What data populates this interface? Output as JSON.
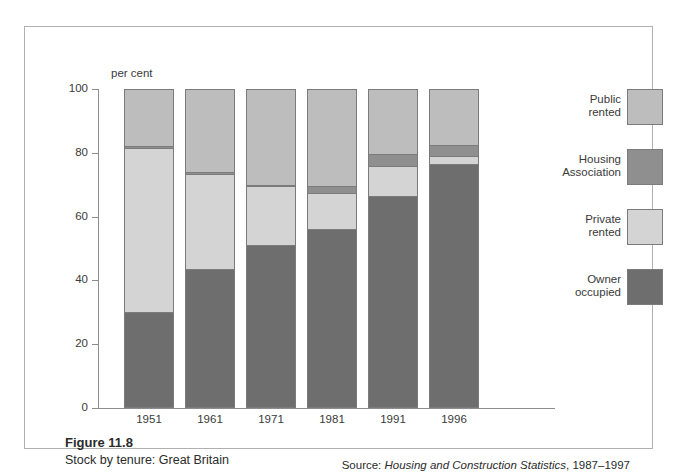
{
  "figure": {
    "number": "Figure 11.8",
    "title": "Stock by tenure: Great Britain",
    "source_prefix": "Source: ",
    "source_italic": "Housing and Construction Statistics",
    "source_suffix": ", 1987–1997"
  },
  "chart_data": {
    "type": "bar",
    "stacked": true,
    "title": "Stock by tenure: Great Britain",
    "xlabel": "",
    "ylabel": "per cent",
    "ylim": [
      0,
      100
    ],
    "yticks": [
      0,
      20,
      40,
      60,
      80,
      100
    ],
    "grid": false,
    "legend_position": "right",
    "categories": [
      "1951",
      "1961",
      "1971",
      "1981",
      "1991",
      "1996"
    ],
    "series": [
      {
        "name": "Owner occupied",
        "color": "#6e6e6e",
        "values": [
          30,
          43.5,
          51,
          56,
          66.5,
          76.5
        ]
      },
      {
        "name": "Private rented",
        "color": "#d4d4d4",
        "values": [
          51.5,
          30,
          18.5,
          11.5,
          9.5,
          2.5
        ]
      },
      {
        "name": "Housing Association",
        "color": "#8f8f8f",
        "values": [
          0.5,
          0.5,
          0.5,
          2,
          3.5,
          3.5
        ]
      },
      {
        "name": "Public rented",
        "color": "#bdbdbd",
        "values": [
          18,
          26,
          30,
          30.5,
          20.5,
          17.5
        ]
      }
    ],
    "annotations": []
  },
  "legend": {
    "items": [
      {
        "label_line1": "Public",
        "label_line2": "rented",
        "color": "#bdbdbd"
      },
      {
        "label_line1": "Housing",
        "label_line2": "Association",
        "color": "#8f8f8f"
      },
      {
        "label_line1": "Private",
        "label_line2": "rented",
        "color": "#d4d4d4"
      },
      {
        "label_line1": "Owner",
        "label_line2": "occupied",
        "color": "#6e6e6e"
      }
    ]
  }
}
